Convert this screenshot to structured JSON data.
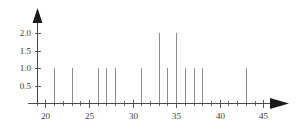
{
  "chart_data": {
    "type": "bar",
    "title": "",
    "subtitle": "",
    "xlabel": "",
    "ylabel": "",
    "xlim": [
      18,
      46
    ],
    "ylim": [
      0,
      2.25
    ],
    "grid": false,
    "legend": null,
    "x_ticks_major": [
      20,
      25,
      30,
      35,
      40,
      45
    ],
    "x_tick_labels": [
      "20",
      "25",
      "30",
      "35",
      "40",
      "45"
    ],
    "x_ticks_minor": [
      19,
      21,
      22,
      23,
      24,
      26,
      27,
      28,
      29,
      31,
      32,
      33,
      34,
      36,
      37,
      38,
      39,
      41,
      42,
      43,
      44,
      46
    ],
    "y_ticks_major": [
      0.5,
      1.0,
      1.5,
      2.0
    ],
    "y_tick_labels": [
      "0.5",
      "1.0",
      "1.5",
      "2.0"
    ],
    "x": [
      21,
      23,
      26,
      27,
      28,
      31,
      33,
      34,
      35,
      36,
      37,
      38,
      43
    ],
    "values": [
      1.0,
      1.0,
      1.0,
      1.0,
      1.0,
      1.0,
      2.0,
      1.0,
      2.0,
      1.0,
      1.0,
      1.0,
      1.0
    ],
    "categories": [
      "21",
      "23",
      "26",
      "27",
      "28",
      "31",
      "33",
      "34",
      "35",
      "36",
      "37",
      "38",
      "43"
    ],
    "series": [
      {
        "name": "frequency",
        "values": [
          1.0,
          1.0,
          1.0,
          1.0,
          1.0,
          1.0,
          2.0,
          1.0,
          2.0,
          1.0,
          1.0,
          1.0,
          1.0
        ]
      }
    ],
    "colors": {
      "stem": "#8a8a8a",
      "axis": "#4a4a4a",
      "text": "#3b3b3b",
      "arrow": "#1a1a1a",
      "background": "#ffffff"
    },
    "axis_arrows": {
      "x_axis": "right-arrow-head",
      "y_axis": "up-arrow-head"
    }
  },
  "icons": {
    "x_axis_arrow": "right-arrow-icon",
    "y_axis_arrow": "up-arrow-icon"
  }
}
